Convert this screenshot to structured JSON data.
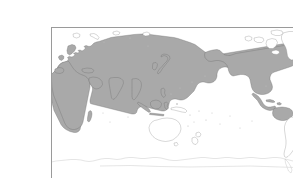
{
  "figure": {
    "kind": "world-distribution-map",
    "projection": "equirectangular",
    "center_longitude": "160E",
    "orientation": "pacific-centered",
    "title": "",
    "caption": "",
    "frame": {
      "visible": true,
      "border_color": "#9a9a9a",
      "background_color": "#ffffff",
      "left_px": 11,
      "top_px": 11,
      "right_px": 282,
      "bottom_px": 167
    },
    "graticule": {
      "visible": false
    }
  },
  "legend": {
    "visible": false,
    "entries": [
      {
        "key": "shaded",
        "label": "",
        "color": "#a9a9a9",
        "meaning": "range / distribution present"
      },
      {
        "key": "unshaded",
        "label": "",
        "color": "#ffffff",
        "meaning": "range / distribution absent"
      }
    ]
  },
  "colors": {
    "land_shaded_fill": "#a9a9a9",
    "land_shaded_stroke": "#6f6f6f",
    "land_plain_fill": "#ffffff",
    "land_plain_stroke": "#8e8e8e",
    "land_faint_stroke": "#b4b4b4",
    "ocean": "#ffffff",
    "frame_border": "#9a9a9a",
    "page_background": "#ffffff"
  },
  "regions": {
    "shaded": [
      {
        "name": "Europe"
      },
      {
        "name": "Siberia and Russia"
      },
      {
        "name": "Central Asia"
      },
      {
        "name": "China and Mongolia"
      },
      {
        "name": "Korea and Japan"
      },
      {
        "name": "India and South Asia"
      },
      {
        "name": "Arabian Peninsula and Middle East"
      },
      {
        "name": "Southeast Asia mainland"
      },
      {
        "name": "Indonesia and Philippines"
      },
      {
        "name": "Africa"
      },
      {
        "name": "Madagascar"
      },
      {
        "name": "Alaska"
      },
      {
        "name": "Canada"
      },
      {
        "name": "United States"
      },
      {
        "name": "Mexico and Central America"
      },
      {
        "name": "Caribbean"
      },
      {
        "name": "Northern South America"
      }
    ],
    "unshaded": [
      {
        "name": "Greenland"
      },
      {
        "name": "Iceland"
      },
      {
        "name": "Svalbard"
      },
      {
        "name": "Novaya Zemlya"
      },
      {
        "name": "Canadian Arctic Archipelago"
      },
      {
        "name": "Australia"
      },
      {
        "name": "New Guinea south"
      },
      {
        "name": "New Zealand"
      },
      {
        "name": "Southern South America"
      },
      {
        "name": "Antarctica"
      }
    ]
  }
}
